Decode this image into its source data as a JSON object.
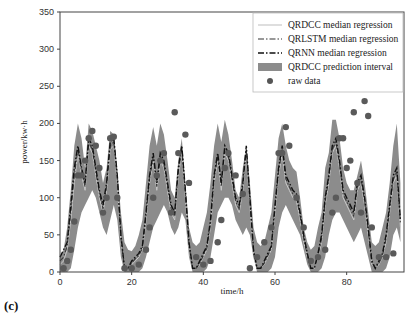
{
  "panel_label": "(c)",
  "chart_data": {
    "type": "line",
    "title": "",
    "xlabel": "time/h",
    "ylabel": "power/kw·h",
    "xlim": [
      0,
      96
    ],
    "ylim": [
      0,
      350
    ],
    "xticks": [
      0,
      20,
      40,
      60,
      80
    ],
    "yticks": [
      0,
      50,
      100,
      150,
      200,
      250,
      300,
      350
    ],
    "grid": false,
    "legend_position": "upper right",
    "legend": [
      {
        "label": "QRDCC median regression",
        "style": "solid-light"
      },
      {
        "label": "QRLSTM median regression",
        "style": "dash-dot"
      },
      {
        "label": "QRNN median regression",
        "style": "dash-dot-dark"
      },
      {
        "label": "QRDCC prediction interval",
        "style": "fill"
      },
      {
        "label": "raw data",
        "style": "marker"
      }
    ],
    "x": [
      0,
      1,
      2,
      3,
      4,
      5,
      6,
      7,
      8,
      9,
      10,
      11,
      12,
      13,
      14,
      15,
      16,
      17,
      18,
      19,
      20,
      21,
      22,
      23,
      24,
      25,
      26,
      27,
      28,
      29,
      30,
      31,
      32,
      33,
      34,
      35,
      36,
      37,
      38,
      39,
      40,
      41,
      42,
      43,
      44,
      45,
      46,
      47,
      48,
      49,
      50,
      51,
      52,
      53,
      54,
      55,
      56,
      57,
      58,
      59,
      60,
      61,
      62,
      63,
      64,
      65,
      66,
      67,
      68,
      69,
      70,
      71,
      72,
      73,
      74,
      75,
      76,
      77,
      78,
      79,
      80,
      81,
      82,
      83,
      84,
      85,
      86,
      87,
      88,
      89,
      90,
      91,
      92,
      93,
      94,
      95
    ],
    "series": [
      {
        "name": "QRDCC prediction interval upper",
        "values": [
          20,
          30,
          60,
          110,
          170,
          200,
          180,
          140,
          200,
          190,
          170,
          150,
          120,
          140,
          190,
          185,
          140,
          80,
          40,
          30,
          28,
          35,
          50,
          70,
          120,
          170,
          195,
          170,
          200,
          185,
          150,
          110,
          100,
          150,
          180,
          120,
          60,
          40,
          35,
          40,
          60,
          80,
          120,
          170,
          200,
          175,
          205,
          185,
          150,
          110,
          100,
          140,
          170,
          120,
          60,
          40,
          35,
          40,
          60,
          80,
          130,
          180,
          200,
          170,
          150,
          140,
          135,
          100,
          60,
          40,
          30,
          35,
          60,
          80,
          140,
          160,
          205,
          205,
          180,
          140,
          120,
          110,
          110,
          130,
          150,
          120,
          80,
          40,
          35,
          40,
          60,
          80,
          120,
          170,
          200,
          120
        ]
      },
      {
        "name": "QRDCC prediction interval lower",
        "values": [
          0,
          0,
          0,
          5,
          30,
          60,
          80,
          90,
          100,
          110,
          100,
          80,
          60,
          50,
          70,
          90,
          70,
          20,
          0,
          0,
          0,
          0,
          0,
          5,
          20,
          40,
          60,
          70,
          80,
          90,
          80,
          60,
          50,
          60,
          80,
          70,
          20,
          0,
          0,
          0,
          0,
          5,
          20,
          50,
          80,
          90,
          100,
          100,
          90,
          70,
          60,
          50,
          60,
          50,
          20,
          0,
          0,
          0,
          0,
          5,
          20,
          60,
          80,
          90,
          80,
          70,
          60,
          50,
          30,
          10,
          0,
          0,
          0,
          5,
          20,
          50,
          70,
          80,
          80,
          70,
          60,
          50,
          40,
          50,
          60,
          40,
          20,
          0,
          0,
          0,
          0,
          5,
          20,
          50,
          60,
          40
        ]
      },
      {
        "name": "QRDCC median regression",
        "values": [
          10,
          15,
          30,
          70,
          120,
          160,
          130,
          110,
          170,
          160,
          130,
          100,
          80,
          110,
          165,
          170,
          120,
          40,
          5,
          5,
          10,
          15,
          20,
          30,
          70,
          120,
          150,
          110,
          150,
          140,
          110,
          80,
          70,
          130,
          160,
          100,
          30,
          5,
          5,
          10,
          20,
          30,
          60,
          120,
          150,
          110,
          160,
          150,
          120,
          90,
          80,
          110,
          160,
          90,
          20,
          5,
          5,
          10,
          20,
          30,
          80,
          130,
          160,
          120,
          110,
          100,
          95,
          70,
          40,
          20,
          5,
          5,
          20,
          40,
          90,
          120,
          160,
          170,
          140,
          100,
          90,
          80,
          70,
          110,
          120,
          90,
          50,
          10,
          5,
          10,
          20,
          40,
          80,
          120,
          130,
          60
        ]
      },
      {
        "name": "QRLSTM median regression",
        "values": [
          15,
          20,
          35,
          80,
          130,
          165,
          135,
          115,
          175,
          165,
          135,
          105,
          85,
          115,
          170,
          175,
          125,
          45,
          5,
          5,
          12,
          18,
          22,
          32,
          75,
          125,
          155,
          115,
          155,
          145,
          115,
          85,
          75,
          135,
          165,
          105,
          35,
          5,
          5,
          12,
          22,
          32,
          65,
          125,
          155,
          115,
          165,
          155,
          125,
          95,
          85,
          115,
          165,
          95,
          25,
          5,
          5,
          12,
          22,
          32,
          85,
          135,
          165,
          125,
          115,
          105,
          100,
          75,
          45,
          22,
          5,
          5,
          22,
          45,
          95,
          125,
          165,
          175,
          145,
          105,
          95,
          85,
          75,
          115,
          125,
          95,
          55,
          12,
          5,
          12,
          22,
          45,
          85,
          125,
          135,
          65
        ]
      },
      {
        "name": "QRNN median regression",
        "values": [
          20,
          30,
          40,
          90,
          140,
          170,
          140,
          120,
          180,
          170,
          140,
          110,
          90,
          120,
          175,
          180,
          130,
          50,
          5,
          5,
          15,
          20,
          25,
          35,
          80,
          130,
          160,
          120,
          160,
          150,
          120,
          90,
          80,
          140,
          170,
          110,
          40,
          5,
          5,
          15,
          25,
          35,
          70,
          130,
          160,
          120,
          170,
          160,
          130,
          100,
          90,
          120,
          170,
          100,
          30,
          5,
          5,
          15,
          25,
          35,
          90,
          140,
          170,
          130,
          120,
          110,
          105,
          80,
          50,
          25,
          5,
          5,
          25,
          50,
          100,
          130,
          170,
          180,
          150,
          110,
          100,
          90,
          80,
          120,
          130,
          100,
          60,
          15,
          5,
          15,
          25,
          50,
          90,
          130,
          140,
          70
        ]
      }
    ],
    "raw_data": [
      [
        1,
        5
      ],
      [
        2,
        15
      ],
      [
        3,
        30
      ],
      [
        4,
        68
      ],
      [
        5,
        130
      ],
      [
        6,
        130
      ],
      [
        7,
        150
      ],
      [
        8,
        180
      ],
      [
        9,
        190
      ],
      [
        10,
        170
      ],
      [
        11,
        140
      ],
      [
        12,
        80
      ],
      [
        13,
        100
      ],
      [
        14,
        180
      ],
      [
        15,
        182
      ],
      [
        16,
        100
      ],
      [
        18,
        5
      ],
      [
        20,
        5
      ],
      [
        22,
        10
      ],
      [
        24,
        30
      ],
      [
        25,
        60
      ],
      [
        26,
        100
      ],
      [
        27,
        130
      ],
      [
        28,
        150
      ],
      [
        29,
        160
      ],
      [
        31,
        80
      ],
      [
        32,
        215
      ],
      [
        33,
        160
      ],
      [
        35,
        185
      ],
      [
        36,
        120
      ],
      [
        38,
        20
      ],
      [
        40,
        10
      ],
      [
        42,
        15
      ],
      [
        44,
        40
      ],
      [
        45,
        70
      ],
      [
        46,
        140
      ],
      [
        47,
        160
      ],
      [
        49,
        130
      ],
      [
        51,
        105
      ],
      [
        53,
        5
      ],
      [
        55,
        20
      ],
      [
        57,
        40
      ],
      [
        59,
        60
      ],
      [
        61,
        160
      ],
      [
        62,
        160
      ],
      [
        63,
        195
      ],
      [
        64,
        170
      ],
      [
        66,
        100
      ],
      [
        68,
        60
      ],
      [
        70,
        15
      ],
      [
        72,
        20
      ],
      [
        74,
        30
      ],
      [
        76,
        80
      ],
      [
        77,
        100
      ],
      [
        78,
        180
      ],
      [
        79,
        180
      ],
      [
        80,
        140
      ],
      [
        81,
        150
      ],
      [
        82,
        215
      ],
      [
        83,
        120
      ],
      [
        84,
        80
      ],
      [
        85,
        230
      ],
      [
        86,
        210
      ],
      [
        87,
        60
      ],
      [
        89,
        20
      ],
      [
        91,
        20
      ],
      [
        93,
        25
      ]
    ]
  }
}
